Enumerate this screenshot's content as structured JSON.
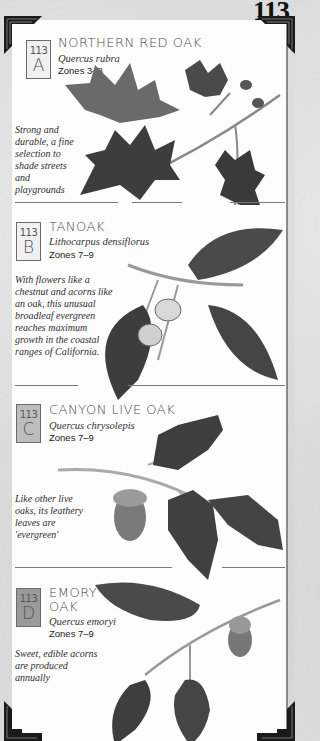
{
  "page": {
    "number": "113"
  },
  "entries": [
    {
      "badge_number": "113",
      "badge_letter": "A",
      "common_name": "Northern Red Oak",
      "scientific_name": "Quercus rubra",
      "zones": "Zones 3–8",
      "description": "Strong and durable, a fine selection to shade streets and playgrounds",
      "illustration": "red-oak-branch-illustration"
    },
    {
      "badge_number": "113",
      "badge_letter": "B",
      "common_name": "Tanoak",
      "scientific_name": "Lithocarpus densiflorus",
      "zones": "Zones 7–9",
      "description": "With flowers like a chestnut and acorns like an oak, this unusual broadleaf evergreen reaches maximum growth in the coastal ranges of California.",
      "illustration": "tanoak-branch-illustration"
    },
    {
      "badge_number": "113",
      "badge_letter": "C",
      "common_name": "Canyon Live Oak",
      "scientific_name": "Quercus chrysolepis",
      "zones": "Zones 7–9",
      "description": "Like other live oaks, its leathery leaves are 'evergreen'",
      "illustration": "canyon-live-oak-branch-illustration"
    },
    {
      "badge_number": "113",
      "badge_letter": "D",
      "common_name_line1": "Emory",
      "common_name_line2": "Oak",
      "scientific_name": "Quercus emoryi",
      "zones": "Zones 7–9",
      "description": "Sweet, edible acorns are produced annually",
      "illustration": "emory-oak-branch-illustration"
    }
  ],
  "colors": {
    "page_background": "#dcdcdc",
    "panel_background": "#fdfdfd",
    "badge_light": "#f0f0f0",
    "badge_shaded": "#bdbdbd",
    "badge_dark": "#9a9a9a",
    "leaf": "#4a4a4a",
    "corner": "#1a1a1a"
  }
}
